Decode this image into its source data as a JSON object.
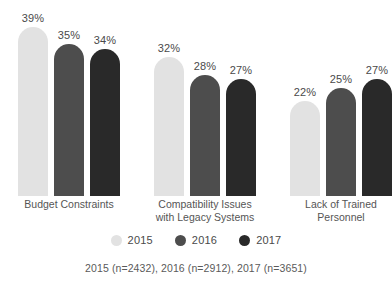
{
  "chart_data": {
    "type": "bar",
    "title": "",
    "subtitle": "",
    "xlabel": "",
    "ylabel": "",
    "ylim": [
      0,
      45
    ],
    "grid": false,
    "legend_position": "bottom",
    "orientation": "vertical",
    "grouped": true,
    "value_suffix": "%",
    "categories": [
      "Budget Constraints",
      "Compatibility Issues\nwith Legacy Systems",
      "Lack of Trained\nPersonnel"
    ],
    "series": [
      {
        "name": "2015",
        "color": "#e2e2e2",
        "values": [
          39,
          32,
          22
        ],
        "labels": [
          "39%",
          "32%",
          "22%"
        ]
      },
      {
        "name": "2016",
        "color": "#4d4d4d",
        "values": [
          35,
          28,
          25
        ],
        "labels": [
          "35%",
          "28%",
          "25%"
        ]
      },
      {
        "name": "2017",
        "color": "#292929",
        "values": [
          34,
          27,
          27
        ],
        "labels": [
          "34%",
          "27%",
          "27%"
        ]
      }
    ],
    "footnote": "2015 (n=2432), 2016 (n=2912), 2017 (n=3651)"
  },
  "legend": {
    "items": [
      {
        "label": "2015",
        "color": "#e2e2e2"
      },
      {
        "label": "2016",
        "color": "#4d4d4d"
      },
      {
        "label": "2017",
        "color": "#292929"
      }
    ]
  },
  "footnote": {
    "text": "2015 (n=2432), 2016 (n=2912), 2017 (n=3651)"
  }
}
